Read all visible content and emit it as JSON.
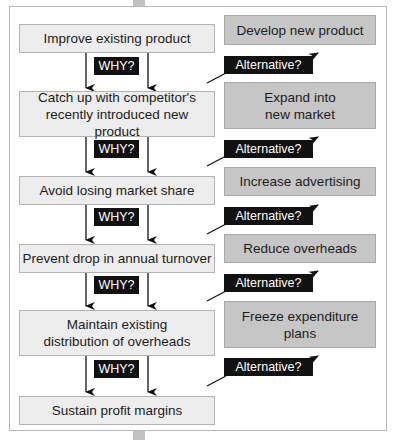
{
  "diagram": {
    "type": "why-alternative ladder",
    "colors": {
      "left_box_fill": "#ededed",
      "right_box_fill": "#c6c6c6",
      "label_fill": "#111111",
      "label_text": "#ffffff"
    },
    "why_label": "WHY?",
    "alternative_label": "Alternative?",
    "steps": [
      {
        "text": "Improve existing product",
        "alternative": "Develop new product"
      },
      {
        "text": "Catch up with competitor's recently introduced new product",
        "alternative": "Expand into new market"
      },
      {
        "text": "Avoid losing market share",
        "alternative": "Increase advertising"
      },
      {
        "text": "Prevent drop in annual turnover",
        "alternative": "Reduce overheads"
      },
      {
        "text": "Maintain existing distribution of overheads",
        "alternative": "Freeze expenditure plans"
      },
      {
        "text": "Sustain profit margins"
      }
    ]
  }
}
